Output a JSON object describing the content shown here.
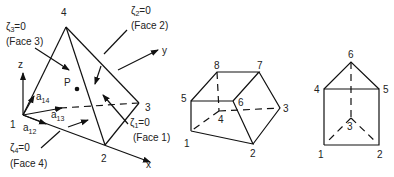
{
  "tetrahedron": {
    "vertices": [
      {
        "id": "1",
        "x": 23,
        "y": 115,
        "lx": 10,
        "ly": 128
      },
      {
        "id": "2",
        "x": 105,
        "y": 145,
        "lx": 101,
        "ly": 162
      },
      {
        "id": "3",
        "x": 139,
        "y": 103,
        "lx": 145,
        "ly": 111
      },
      {
        "id": "4",
        "x": 66,
        "y": 27,
        "lx": 61,
        "ly": 16
      }
    ],
    "point_label": "P",
    "axes": {
      "x": "x",
      "y": "y",
      "z": "z"
    },
    "vectors": [
      {
        "name": "a",
        "sub": "14"
      },
      {
        "name": "a",
        "sub": "13"
      },
      {
        "name": "a",
        "sub": "12"
      }
    ],
    "faces": [
      {
        "zeta": "ζ",
        "sub": "1",
        "eq": "=0",
        "face": "(Face 1)"
      },
      {
        "zeta": "ζ",
        "sub": "2",
        "eq": "=0",
        "face": "(Face 2)"
      },
      {
        "zeta": "ζ",
        "sub": "3",
        "eq": "=0",
        "face": "(Face 3)"
      },
      {
        "zeta": "ζ",
        "sub": "4",
        "eq": "=0",
        "face": "(Face 4)"
      }
    ]
  },
  "hexahedron": {
    "vertices": [
      {
        "id": "1",
        "x": 191,
        "y": 131
      },
      {
        "id": "2",
        "x": 253,
        "y": 144
      },
      {
        "id": "3",
        "x": 280,
        "y": 108
      },
      {
        "id": "4",
        "x": 219,
        "y": 111
      },
      {
        "id": "5",
        "x": 191,
        "y": 101
      },
      {
        "id": "6",
        "x": 233,
        "y": 101
      },
      {
        "id": "7",
        "x": 259,
        "y": 72
      },
      {
        "id": "8",
        "x": 217,
        "y": 72
      }
    ]
  },
  "prism": {
    "vertices": [
      {
        "id": "1",
        "x": 324,
        "y": 145
      },
      {
        "id": "2",
        "x": 379,
        "y": 145
      },
      {
        "id": "3",
        "x": 351,
        "y": 118
      },
      {
        "id": "4",
        "x": 324,
        "y": 89
      },
      {
        "id": "5",
        "x": 379,
        "y": 89
      },
      {
        "id": "6",
        "x": 351,
        "y": 62
      }
    ]
  }
}
